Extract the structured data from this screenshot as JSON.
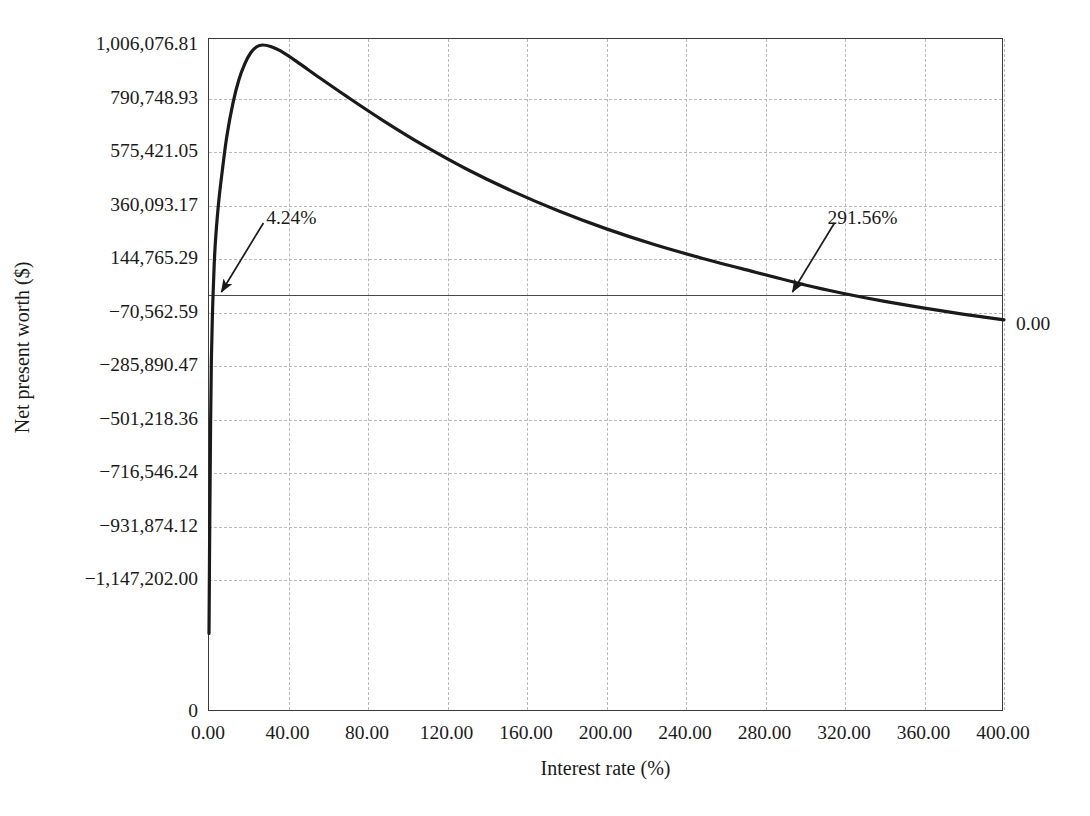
{
  "chart_data": {
    "type": "line",
    "title": "",
    "xlabel": "Interest rate (%)",
    "ylabel": "Net present worth ($)",
    "xlim": [
      0,
      400
    ],
    "ylim": [
      -1362529.88,
      1006076.81
    ],
    "grid": true,
    "legend": null,
    "x_tick_labels": [
      "0.00",
      "40.00",
      "80.00",
      "120.00",
      "160.00",
      "200.00",
      "240.00",
      "280.00",
      "320.00",
      "360.00",
      "400.00"
    ],
    "x_tick_values": [
      0,
      40,
      80,
      120,
      160,
      200,
      240,
      280,
      320,
      360,
      400
    ],
    "y_tick_labels": [
      "1,006,076.81",
      "790,748.93",
      "575,421.05",
      "360,093.17",
      "144,765.29",
      "−70,562.59",
      "−285,890.47",
      "−501,218.36",
      "−716,546.24",
      "−931,874.12",
      "−1,147,202.00",
      "0"
    ],
    "y_tick_values": [
      1006076.81,
      790748.93,
      575421.05,
      360093.17,
      144765.29,
      -70562.59,
      -285890.47,
      -501218.36,
      -716546.24,
      -931874.12,
      -1147202.0,
      null
    ],
    "zero_line_label": "0.00",
    "annotations": [
      {
        "name": "lower-irr",
        "label": "4.24%",
        "x": 4.24,
        "y": 0
      },
      {
        "name": "upper-irr",
        "label": "291.56%",
        "x": 291.56,
        "y": 0
      }
    ],
    "series": [
      {
        "name": "Net present worth",
        "color": "#1a1a1a",
        "points": [
          [
            0.0,
            -1362000
          ],
          [
            0.4,
            -900000
          ],
          [
            0.8,
            -520000
          ],
          [
            1.2,
            -260000
          ],
          [
            1.8,
            -60000
          ],
          [
            2.6,
            120000
          ],
          [
            3.4,
            235000
          ],
          [
            4.24,
            0
          ],
          [
            5.0,
            385000
          ],
          [
            7.0,
            520000
          ],
          [
            9.0,
            640000
          ],
          [
            12.0,
            770000
          ],
          [
            15.0,
            865000
          ],
          [
            18.0,
            930000
          ],
          [
            21.0,
            975000
          ],
          [
            24.0,
            999000
          ],
          [
            27.0,
            1006076
          ],
          [
            31.0,
            1000000
          ],
          [
            36.0,
            982000
          ],
          [
            44.0,
            940000
          ],
          [
            56.0,
            872000
          ],
          [
            70.0,
            795000
          ],
          [
            88.0,
            700000
          ],
          [
            108.0,
            602000
          ],
          [
            130.0,
            505000
          ],
          [
            152.0,
            420000
          ],
          [
            176.0,
            338000
          ],
          [
            200.0,
            266000
          ],
          [
            224.0,
            203000
          ],
          [
            248.0,
            148000
          ],
          [
            268.0,
            106000
          ],
          [
            291.56,
            0
          ],
          [
            300.0,
            40000
          ],
          [
            320.0,
            5000
          ],
          [
            340.0,
            -26000
          ],
          [
            360.0,
            -53000
          ],
          [
            380.0,
            -78000
          ],
          [
            400.0,
            -100000
          ]
        ]
      }
    ]
  }
}
